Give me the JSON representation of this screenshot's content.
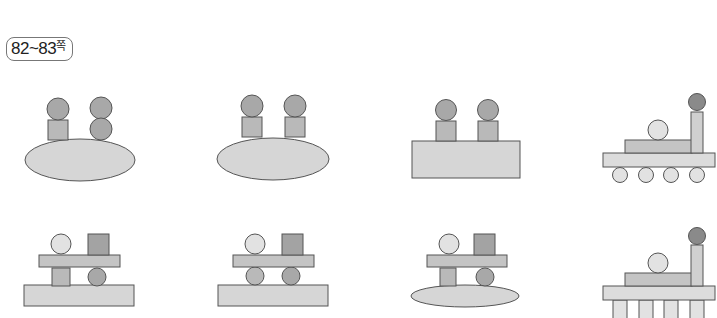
{
  "page_label": {
    "pages": "82~83",
    "suffix": "쪽"
  },
  "colors": {
    "stroke": "#555555",
    "base_light": "#d6d6d6",
    "block_mid": "#b9b9b9",
    "ball_mid": "#a8a8a8",
    "ball_light": "#e2e2e2",
    "ball_dark": "#8a8a8a",
    "square_dark": "#a3a3a3"
  },
  "figures": [
    {
      "row": 1,
      "col": 1,
      "description": "ellipse base with square+ball on left and two stacked balls on right"
    },
    {
      "row": 1,
      "col": 2,
      "description": "ellipse base with two square+ball columns"
    },
    {
      "row": 1,
      "col": 3,
      "description": "rectangle base with two square+ball columns"
    },
    {
      "row": 1,
      "col": 4,
      "description": "train: platform on four wheels, long block, ball, chimney with dark ball"
    },
    {
      "row": 2,
      "col": 1,
      "description": "rectangle base, pillar and ball supporting plank with ball and square on top"
    },
    {
      "row": 2,
      "col": 2,
      "description": "rectangle base, two balls supporting plank with ball and square on top"
    },
    {
      "row": 2,
      "col": 3,
      "description": "ellipse base, pillar and ball supporting plank with ball and square on top"
    },
    {
      "row": 2,
      "col": 4,
      "description": "platform on four pillars, long block, ball, chimney with dark ball"
    }
  ]
}
